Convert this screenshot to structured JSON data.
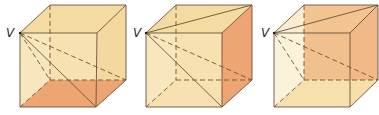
{
  "figure": {
    "colors": {
      "face_fill": "#F6DFAB",
      "shaded_face": "#EDA574",
      "edge": "#6b5436",
      "background": "#ffffff"
    },
    "cubes": [
      {
        "id": "cube-1",
        "vertex_label": "V",
        "shaded_face": "bottom",
        "offset_x": 0
      },
      {
        "id": "cube-2",
        "vertex_label": "V",
        "shaded_face": "right",
        "offset_x": 126
      },
      {
        "id": "cube-3",
        "vertex_label": "V",
        "shaded_face": "back",
        "offset_x": 254
      }
    ]
  }
}
